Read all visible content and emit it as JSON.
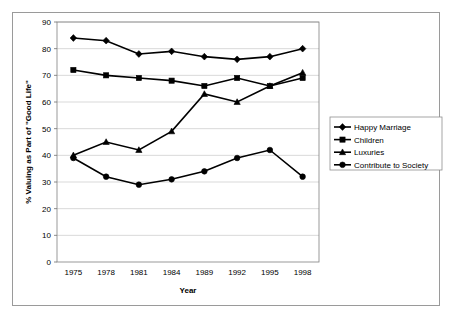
{
  "chart_data": {
    "type": "line",
    "title": "",
    "xlabel": "Year",
    "ylabel": "% Valuing as Part of \"Good Life\"",
    "categories": [
      "1975",
      "1978",
      "1981",
      "1984",
      "1989",
      "1992",
      "1995",
      "1998"
    ],
    "ylim": [
      0,
      90
    ],
    "ytick_step": 10,
    "yticks": [
      "0",
      "10",
      "20",
      "30",
      "40",
      "50",
      "60",
      "70",
      "80",
      "90"
    ],
    "grid": true,
    "grid_axis": "y",
    "legend_position": "right",
    "series": [
      {
        "name": "Happy Marriage",
        "marker": "diamond",
        "color": "#000000",
        "values": [
          84,
          83,
          78,
          79,
          77,
          76,
          77,
          80
        ]
      },
      {
        "name": "Children",
        "marker": "square",
        "color": "#000000",
        "values": [
          72,
          70,
          69,
          68,
          66,
          69,
          66,
          69
        ]
      },
      {
        "name": "Luxuries",
        "marker": "triangle",
        "color": "#000000",
        "values": [
          40,
          45,
          42,
          49,
          63,
          60,
          66,
          71
        ]
      },
      {
        "name": "Contribute to Society",
        "marker": "circle",
        "color": "#000000",
        "values": [
          39,
          32,
          29,
          31,
          34,
          39,
          42,
          32
        ]
      }
    ]
  },
  "legend": {
    "items": [
      {
        "label": "Happy Marriage"
      },
      {
        "label": "Children"
      },
      {
        "label": "Luxuries"
      },
      {
        "label": "Contribute to Society"
      }
    ]
  },
  "axes": {
    "x_title": "Year",
    "y_title": "% Valuing as Part of \"Good Life\""
  }
}
